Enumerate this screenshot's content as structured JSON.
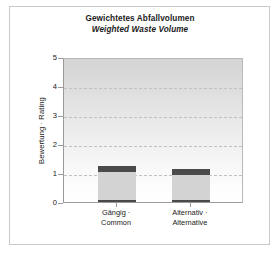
{
  "chart_data": {
    "type": "bar",
    "title": "Gewichtetes Abfallvolumen",
    "subtitle": "Weighted Waste Volume",
    "xlabel": "",
    "ylabel": "Bewertung · Rating",
    "ylim": [
      0,
      5
    ],
    "yticks": [
      "0",
      "1",
      "2",
      "3",
      "4",
      "5"
    ],
    "grid": "horizontal-dashed-at-1-2-3-4",
    "legend": "none",
    "stacked": true,
    "categories": [
      "Gängig · Common",
      "Alternativ · Alternative"
    ],
    "category_lines": [
      {
        "de": "Gängig ·",
        "en": "Common"
      },
      {
        "de": "Alternativ ·",
        "en": "Alternative"
      }
    ],
    "series": [
      {
        "name": "base",
        "values": [
          0.07,
          0.07
        ],
        "color": "#4a4a4a"
      },
      {
        "name": "body",
        "values": [
          0.98,
          0.87
        ],
        "color": "#d3d3d3"
      },
      {
        "name": "cap",
        "values": [
          0.2,
          0.21
        ],
        "color": "#4a4a4a"
      }
    ],
    "totals": [
      1.25,
      1.15
    ]
  },
  "colors": {
    "background": "#ffffff",
    "frame": "#c9c9c9",
    "axis": "#9a9a9a",
    "grid": "#c0c0c0",
    "bar_dark": "#4a4a4a",
    "bar_light": "#d3d3d3",
    "text": "#1a1a1a"
  }
}
